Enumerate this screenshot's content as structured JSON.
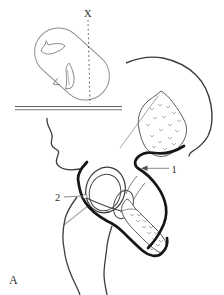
{
  "figure": {
    "panel_label": "A",
    "beam_label": "X",
    "pointer_labels": {
      "one": "1",
      "two": "2"
    }
  },
  "colors": {
    "background": "#ffffff",
    "thin_outline": "#3d3d3d",
    "light_outline": "#909090",
    "thick_line": "#161616",
    "leader_line": "#8a8a8a",
    "label_text": "#2f2f2f"
  }
}
